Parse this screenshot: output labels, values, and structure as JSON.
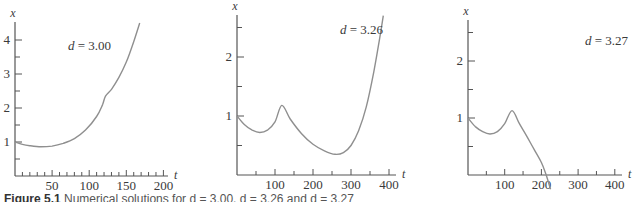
{
  "figure": {
    "caption_label": "Figure 5.1",
    "caption_text": "Numerical solutions for d = 3.00, d = 3.26 and d = 3.27",
    "curve_color": "#8f8f8f",
    "axis_color": "#555555"
  },
  "chart_data": [
    {
      "type": "line",
      "title": "d = 3.00",
      "annotation": "d = 3.00",
      "xlabel": "t",
      "ylabel": "x",
      "xlim": [
        0,
        205
      ],
      "ylim": [
        0,
        4.5
      ],
      "x_ticks": [
        50,
        100,
        150,
        200
      ],
      "x_minor_step": 10,
      "y_ticks": [
        1,
        2,
        3,
        4
      ],
      "y_minor_step": 0.5,
      "grid": false,
      "series": [
        {
          "name": "x(t)",
          "x": [
            0,
            10,
            20,
            35,
            50,
            65,
            80,
            95,
            110,
            118,
            122,
            130,
            140,
            150,
            160,
            168
          ],
          "y": [
            1.0,
            0.93,
            0.89,
            0.86,
            0.88,
            0.96,
            1.1,
            1.35,
            1.75,
            2.1,
            2.35,
            2.55,
            2.9,
            3.35,
            3.95,
            4.5
          ]
        }
      ]
    },
    {
      "type": "line",
      "title": "d = 3.26",
      "annotation": "d = 3.26",
      "xlabel": "t",
      "ylabel": "x",
      "xlim": [
        0,
        420
      ],
      "ylim": [
        0,
        2.7
      ],
      "x_ticks": [
        100,
        200,
        300,
        400
      ],
      "x_minor_step": 50,
      "y_ticks": [
        1,
        2
      ],
      "y_minor_step": 0.5,
      "grid": false,
      "series": [
        {
          "name": "x(t)",
          "x": [
            0,
            20,
            40,
            60,
            80,
            100,
            118,
            140,
            170,
            200,
            230,
            258,
            280,
            300,
            320,
            340,
            360,
            375,
            385
          ],
          "y": [
            1.0,
            0.85,
            0.76,
            0.72,
            0.76,
            0.9,
            1.18,
            0.95,
            0.7,
            0.52,
            0.41,
            0.35,
            0.38,
            0.5,
            0.75,
            1.15,
            1.75,
            2.3,
            2.7
          ]
        }
      ]
    },
    {
      "type": "line",
      "title": "d = 3.27",
      "annotation": "d = 3.27",
      "xlabel": "t",
      "ylabel": "x",
      "xlim": [
        0,
        420
      ],
      "ylim": [
        0,
        2.7
      ],
      "x_ticks": [
        100,
        200,
        300,
        400
      ],
      "x_minor_step": 50,
      "y_ticks": [
        1,
        2
      ],
      "y_minor_step": 0.5,
      "grid": false,
      "series": [
        {
          "name": "x(t)",
          "x": [
            0,
            20,
            40,
            60,
            80,
            100,
            120,
            140,
            160,
            180,
            200,
            213,
            225
          ],
          "y": [
            1.0,
            0.85,
            0.76,
            0.72,
            0.76,
            0.9,
            1.13,
            0.9,
            0.68,
            0.45,
            0.22,
            0.0,
            -0.25
          ]
        }
      ]
    }
  ],
  "layout": {
    "panels": [
      {
        "ox": 15,
        "oy": 176,
        "px_per_t": 0.742,
        "px_per_x": 34.0,
        "axis_top": 22,
        "axis_right": 168,
        "label_x": 68,
        "label_y": 50
      },
      {
        "ox": 237,
        "oy": 175,
        "px_per_t": 0.38,
        "px_per_x": 59.0,
        "axis_top": 15,
        "axis_right": 396,
        "label_x": 340,
        "label_y": 34
      },
      {
        "ox": 468,
        "oy": 175,
        "px_per_t": 0.367,
        "px_per_x": 57.0,
        "axis_top": 20,
        "axis_right": 622,
        "label_x": 585,
        "label_y": 45
      }
    ]
  }
}
